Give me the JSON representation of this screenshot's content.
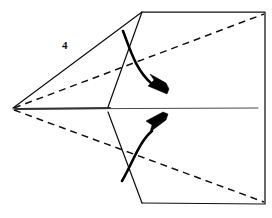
{
  "diagram": {
    "background_color": "#ffffff",
    "line_color": "#111111",
    "dashed_line_color": "#111111",
    "center_line_color": "#4a4a4a",
    "arrow_color": "#000000",
    "canvas": {
      "width": 272,
      "height": 218
    },
    "step_label": {
      "text": "4",
      "x": 62,
      "y": 40
    },
    "outline": {
      "name": "paper-outline",
      "points": "13,108 142,12 265,12 265,204 142,203",
      "apex": {
        "x": 13,
        "y": 109
      },
      "top_corner": {
        "x": 142,
        "y": 12
      },
      "top_right_corner": {
        "x": 265,
        "y": 12
      },
      "bottom_right_corner": {
        "x": 265,
        "y": 204
      },
      "bottom_corner": {
        "x": 142,
        "y": 203
      }
    },
    "inner_flap_upper": {
      "name": "inner-flap-upper-edge",
      "points": "142,12 108,107"
    },
    "inner_flap_lower": {
      "name": "inner-flap-lower-edge",
      "points": "108,112 142,203"
    },
    "center_line": {
      "name": "center-crease-line",
      "from": {
        "x": 13,
        "y": 109
      },
      "to": {
        "x": 258,
        "y": 108
      },
      "thick_from": {
        "x": 16,
        "y": 109
      },
      "thick_to": {
        "x": 110,
        "y": 108
      }
    },
    "dashed_fold_upper": {
      "name": "dashed-fold-line-upper",
      "from": {
        "x": 14,
        "y": 108
      },
      "to": {
        "x": 264,
        "y": 14
      }
    },
    "dashed_fold_lower": {
      "name": "dashed-fold-line-lower",
      "from": {
        "x": 14,
        "y": 110
      },
      "to": {
        "x": 264,
        "y": 202
      }
    },
    "arrow_upper": {
      "name": "fold-arrow-upper",
      "direction": "down-right",
      "path": "M123,31 C131,52 136,70 152,84",
      "head_points": "167,94 148,86 154,80 150,74 166,83 169,89"
    },
    "arrow_lower": {
      "name": "fold-arrow-lower",
      "direction": "up-right",
      "path": "M122,181 C133,162 139,142 152,131",
      "head_points": "166,120 150,132 152,125 146,121 163,112 168,114"
    }
  }
}
